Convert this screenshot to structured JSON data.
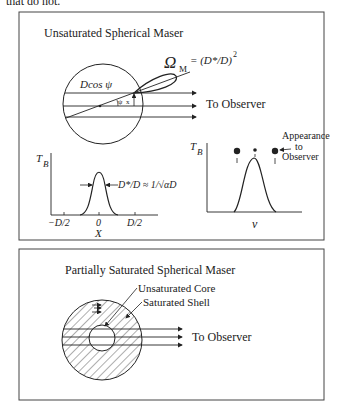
{
  "intro_fragment": "that do not.",
  "panel_top": {
    "title": "Unsaturated Spherical Maser",
    "beam_formula": "ΩM = (D*/D)²",
    "omega_symbol": "Ω",
    "omega_subscript": "M",
    "omega_rhs": "= (D*/D)",
    "omega_exp": "2",
    "chord_label": "Dcos ψ",
    "angle_label": "ψ",
    "x_label": "x",
    "to_observer": "To Observer",
    "plot_left": {
      "ylabel": "T",
      "ylabel_sub": "B",
      "xlabel": "X",
      "ticks": [
        "−D/2",
        "0",
        "D/2"
      ],
      "width_annotation": "D*/D ≈ 1/√αD"
    },
    "plot_right": {
      "ylabel": "T",
      "ylabel_sub": "B",
      "xlabel": "ν",
      "appearance_label": [
        "Appearance",
        "to",
        "Observer"
      ]
    }
  },
  "panel_bottom": {
    "title": "Partially Saturated Spherical Maser",
    "core_label": "Unsaturated Core",
    "shell_label": "Saturated Shell",
    "to_observer": "To Observer"
  }
}
